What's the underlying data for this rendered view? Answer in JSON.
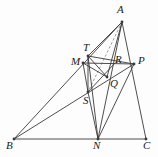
{
  "figure": {
    "kind": "geometry-diagram",
    "stroke_color": "#3a3a3a",
    "dash_color": "#6b6b6b",
    "background_color": "#fdfdfd",
    "width": 158,
    "height": 157
  },
  "points": {
    "A": {
      "label": "A",
      "x": 122,
      "y": 22,
      "label_x": 117,
      "label_y": 4
    },
    "B": {
      "label": "B",
      "x": 14,
      "y": 139,
      "label_x": 6,
      "label_y": 140
    },
    "C": {
      "label": "C",
      "x": 146,
      "y": 139,
      "label_x": 143,
      "label_y": 140
    },
    "N": {
      "label": "N",
      "x": 98,
      "y": 139,
      "label_x": 93,
      "label_y": 140
    },
    "M": {
      "label": "M",
      "x": 83,
      "y": 63,
      "label_x": 71,
      "label_y": 56
    },
    "T": {
      "label": "T",
      "x": 88,
      "y": 56,
      "label_x": 83,
      "label_y": 42
    },
    "R": {
      "label": "R",
      "x": 115,
      "y": 63,
      "label_x": 115,
      "label_y": 54
    },
    "P": {
      "label": "P",
      "x": 134,
      "y": 64,
      "label_x": 138,
      "label_y": 55
    },
    "Q": {
      "label": "Q",
      "x": 107,
      "y": 77,
      "label_x": 110,
      "label_y": 78
    },
    "S": {
      "label": "S",
      "x": 88,
      "y": 92,
      "label_x": 83,
      "label_y": 95
    }
  },
  "segments": [
    {
      "name": "side-BC",
      "from": "B",
      "to": "C",
      "style": "solid"
    },
    {
      "name": "side-AB",
      "from": "A",
      "to": "B",
      "style": "solid"
    },
    {
      "name": "side-AC",
      "from": "A",
      "to": "C",
      "style": "solid"
    },
    {
      "name": "cevian-AN",
      "from": "A",
      "to": "N",
      "style": "solid"
    },
    {
      "name": "cevian-AT",
      "from": "A",
      "to": "T",
      "style": "solid"
    },
    {
      "name": "cevian-AS",
      "from": "A",
      "to": "S",
      "style": "dashed"
    },
    {
      "name": "cevian-AQ",
      "from": "A",
      "to": "Q",
      "style": "solid"
    },
    {
      "name": "segment-MP",
      "from": "M",
      "to": "P",
      "style": "solid"
    },
    {
      "name": "segment-TP",
      "from": "T",
      "to": "P",
      "style": "solid"
    },
    {
      "name": "segment-TS",
      "from": "T",
      "to": "S",
      "style": "solid"
    },
    {
      "name": "segment-TQ",
      "from": "T",
      "to": "Q",
      "style": "solid"
    },
    {
      "name": "segment-MS",
      "from": "M",
      "to": "S",
      "style": "solid"
    },
    {
      "name": "segment-MQ",
      "from": "M",
      "to": "Q",
      "style": "solid"
    },
    {
      "name": "segment-BQP",
      "from": "B",
      "to": "P",
      "style": "solid"
    },
    {
      "name": "segment-SN",
      "from": "S",
      "to": "N",
      "style": "solid"
    },
    {
      "name": "segment-TN",
      "from": "T",
      "to": "N",
      "style": "solid"
    },
    {
      "name": "segment-PN",
      "from": "P",
      "to": "N",
      "style": "solid"
    },
    {
      "name": "segment-SR",
      "from": "S",
      "to": "R",
      "style": "solid"
    }
  ],
  "dots": [
    "A",
    "M",
    "T",
    "P",
    "S",
    "Q",
    "N",
    "B",
    "C"
  ]
}
